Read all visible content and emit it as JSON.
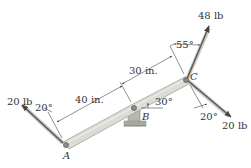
{
  "diagram": {
    "type": "statics-lever-free-body",
    "points": {
      "A": {
        "label": "A",
        "x": 66,
        "y": 145
      },
      "B": {
        "label": "B",
        "x": 134,
        "y": 108
      },
      "C": {
        "label": "C",
        "x": 186,
        "y": 80
      }
    },
    "dimensions": {
      "AB": "40 in.",
      "BC": "30 in."
    },
    "angles": {
      "lever_BC_from_horizontal": "30°",
      "force_A_from_perpendicular": "20°",
      "force_C_up_from_perpendicular": "55°",
      "force_C_down_from_line": "20°"
    },
    "forces": [
      {
        "name": "force-at-A",
        "label": "20 lb",
        "at": "A"
      },
      {
        "name": "force-at-C-up",
        "label": "48 lb",
        "at": "C"
      },
      {
        "name": "force-at-C-down",
        "label": "20 lb",
        "at": "C"
      }
    ],
    "colors": {
      "member_fill": "#d9d9d4",
      "member_stroke": "#9a9a94",
      "arrow": "#5a5a5a",
      "text": "#333333",
      "support": "#a8a8a0"
    }
  }
}
